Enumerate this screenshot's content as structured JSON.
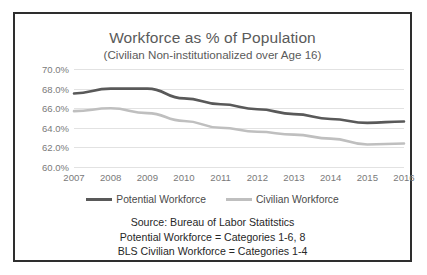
{
  "figure": {
    "border_color": "#2e2e2e",
    "background": "#ffffff"
  },
  "chart_data": {
    "type": "line",
    "title": "Workforce as % of Population",
    "subtitle": "(Civilian Non-institutionalized over Age 16)",
    "xlabel": "",
    "ylabel": "",
    "categories": [
      "2007",
      "2008",
      "2009",
      "2010",
      "2011",
      "2012",
      "2013",
      "2014",
      "2015",
      "2016"
    ],
    "x": [
      2007,
      2008,
      2009,
      2010,
      2011,
      2012,
      2013,
      2014,
      2015,
      2016
    ],
    "ylim": [
      60.0,
      70.0
    ],
    "ytick_labels": [
      "70.0%",
      "68.0%",
      "66.0%",
      "64.0%",
      "62.0%",
      "60.0%"
    ],
    "ytick_values": [
      70.0,
      68.0,
      66.0,
      64.0,
      62.0,
      60.0
    ],
    "grid": true,
    "legend_position": "bottom",
    "series": [
      {
        "name": "Potential Workforce",
        "color": "#595959",
        "values": [
          67.5,
          68.0,
          68.0,
          67.0,
          66.4,
          65.9,
          65.4,
          64.9,
          64.5,
          64.65
        ]
      },
      {
        "name": "Civilian Workforce",
        "color": "#bfbfbf",
        "values": [
          65.7,
          66.0,
          65.5,
          64.7,
          64.0,
          63.6,
          63.3,
          62.9,
          62.3,
          62.4
        ]
      }
    ],
    "annotations": [
      "Source:  Bureau of Labor Statitstics",
      "Potential Workforce = Categories 1-6, 8",
      "BLS Civilian Workforce = Categories 1-4"
    ]
  }
}
